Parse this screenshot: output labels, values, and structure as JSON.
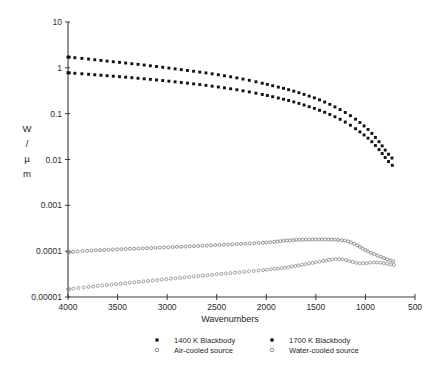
{
  "chart_data": {
    "type": "line",
    "title": "",
    "xlabel": "Wavenumbers",
    "ylabel": "W / µ m",
    "ylabel_lines": [
      "W",
      "/",
      "µ",
      "m"
    ],
    "xlim": [
      4000,
      500
    ],
    "ylim": [
      1e-05,
      10
    ],
    "xscale": "linear",
    "yscale": "log",
    "x_reversed": true,
    "grid": false,
    "legend_position": "below-axes",
    "xticks": [
      4000,
      3500,
      3000,
      2500,
      2000,
      1500,
      1000,
      500
    ],
    "xtick_labels": [
      "4000",
      "3500",
      "3000",
      "2500",
      "2000",
      "1500",
      "1000",
      "500"
    ],
    "yticks": [
      10,
      1,
      0.1,
      0.01,
      0.001,
      0.0001,
      1e-05
    ],
    "ytick_labels": [
      "10",
      "1",
      "0.1",
      "0.01",
      "0.001",
      "0.0001",
      "0.00001"
    ],
    "series": [
      {
        "name": "1700 K Blackbody",
        "marker": "filled-square",
        "color": "#111111",
        "x": [
          4000,
          3800,
          3600,
          3400,
          3200,
          3000,
          2800,
          2600,
          2400,
          2200,
          2000,
          1900,
          1800,
          1700,
          1600,
          1500,
          1400,
          1300,
          1200,
          1100,
          1000,
          950,
          900,
          850,
          800,
          760,
          720,
          700
        ],
        "y": [
          1.72,
          1.56,
          1.4,
          1.26,
          1.13,
          1.0,
          0.88,
          0.77,
          0.66,
          0.55,
          0.44,
          0.39,
          0.345,
          0.3,
          0.255,
          0.215,
          0.175,
          0.138,
          0.105,
          0.076,
          0.051,
          0.04,
          0.0305,
          0.0225,
          0.016,
          0.0125,
          0.0101,
          0.0094
        ]
      },
      {
        "name": "1400 K Blackbody",
        "marker": "filled-square",
        "color": "#111111",
        "x": [
          4000,
          3800,
          3600,
          3400,
          3200,
          3000,
          2800,
          2600,
          2400,
          2200,
          2000,
          1900,
          1800,
          1700,
          1600,
          1500,
          1400,
          1300,
          1200,
          1100,
          1000,
          950,
          900,
          850,
          800,
          760,
          720,
          700
        ],
        "y": [
          0.78,
          0.725,
          0.672,
          0.62,
          0.568,
          0.516,
          0.464,
          0.412,
          0.36,
          0.306,
          0.252,
          0.225,
          0.2,
          0.175,
          0.15,
          0.127,
          0.105,
          0.084,
          0.065,
          0.047,
          0.0325,
          0.0262,
          0.0203,
          0.0152,
          0.011,
          0.0087,
          0.0072,
          0.0068
        ]
      },
      {
        "name": "Air-cooled source",
        "marker": "open-circle",
        "color": "#7a7a7a",
        "x": [
          4000,
          3800,
          3600,
          3400,
          3200,
          3000,
          2800,
          2600,
          2400,
          2200,
          2000,
          1900,
          1800,
          1700,
          1600,
          1500,
          1400,
          1300,
          1200,
          1150,
          1100,
          1050,
          1000,
          950,
          900,
          850,
          800,
          750,
          700
        ],
        "y": [
          9.5e-05,
          0.000102,
          0.0001075,
          0.000112,
          0.000116,
          0.0001215,
          0.0001265,
          0.0001325,
          0.0001395,
          0.000146,
          0.0001545,
          0.000162,
          0.00017,
          0.000176,
          0.000179,
          0.00018,
          0.0001795,
          0.0001775,
          0.000169,
          0.000156,
          0.00014,
          0.000122,
          0.000106,
          9.35e-05,
          8.4e-05,
          7.6e-05,
          6.9e-05,
          6.3e-05,
          5.9e-05
        ]
      },
      {
        "name": "Water-cooled source",
        "marker": "open-circle",
        "color": "#8a8a8a",
        "x": [
          4000,
          3800,
          3600,
          3400,
          3200,
          3000,
          2800,
          2600,
          2400,
          2200,
          2000,
          1900,
          1800,
          1700,
          1600,
          1500,
          1400,
          1350,
          1300,
          1250,
          1200,
          1150,
          1100,
          1050,
          1000,
          950,
          900,
          850,
          800,
          750,
          700
        ],
        "y": [
          1.48e-05,
          1.65e-05,
          1.83e-05,
          2.02e-05,
          2.23e-05,
          2.46e-05,
          2.71e-05,
          2.98e-05,
          3.27e-05,
          3.58e-05,
          3.92e-05,
          4.15e-05,
          4.4e-05,
          4.78e-05,
          5.24e-05,
          5.7e-05,
          6.25e-05,
          6.55e-05,
          6.72e-05,
          6.68e-05,
          6.4e-05,
          6e-05,
          5.62e-05,
          5.4e-05,
          5.45e-05,
          5.62e-05,
          5.7e-05,
          5.6e-05,
          5.4e-05,
          5.15e-05,
          4.95e-05
        ]
      }
    ]
  },
  "legend": {
    "entries": [
      {
        "label": "1400 K Blackbody",
        "marker": "filled-square"
      },
      {
        "label": "1700 K Blackbody",
        "marker": "filled-square"
      },
      {
        "label": "Air-cooled source",
        "marker": "open-circle"
      },
      {
        "label": "Water-cooled source",
        "marker": "open-circle"
      }
    ]
  },
  "colors": {
    "axis": "#3a3a3a",
    "blackbody": "#111111",
    "source": "#808080",
    "background": "#ffffff"
  }
}
